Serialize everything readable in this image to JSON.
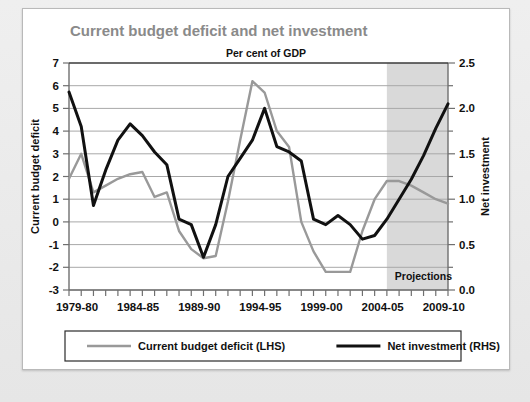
{
  "chart_data": {
    "type": "line",
    "title": "Current budget deficit and net investment",
    "subtitle": "Per cent of GDP",
    "annotation": "Projections",
    "xlabel": "",
    "ylabel": "Current budget deficit",
    "y2label": "Net investment",
    "grid": true,
    "legend_position": "bottom",
    "ylim": [
      -3,
      7
    ],
    "y2lim": [
      0.0,
      2.5
    ],
    "yticks": [
      7,
      6,
      5,
      4,
      3,
      2,
      1,
      0,
      -1,
      -2,
      -3
    ],
    "ytick_labels": [
      "7",
      "6",
      "5",
      "4",
      "3",
      "2",
      "1",
      "0",
      "-1",
      "-2",
      "-3"
    ],
    "y2ticks": [
      2.5,
      2.0,
      1.5,
      1.0,
      0.5,
      0.0
    ],
    "y2tick_labels": [
      "2.5",
      "2.0",
      "1.5",
      "1.0",
      "0.5",
      "0.0"
    ],
    "x": [
      "1979-80",
      "1980-81",
      "1981-82",
      "1982-83",
      "1983-84",
      "1984-85",
      "1985-86",
      "1986-87",
      "1987-88",
      "1988-89",
      "1989-90",
      "1990-91",
      "1991-92",
      "1992-93",
      "1993-94",
      "1994-95",
      "1995-96",
      "1996-97",
      "1997-98",
      "1998-99",
      "1999-00",
      "2000-01",
      "2001-02",
      "2002-03",
      "2003-04",
      "2004-05",
      "2005-06",
      "2006-07",
      "2007-08",
      "2008-09",
      "2009-10",
      "2010-11"
    ],
    "xtick_labels": [
      "1979-80",
      "1984-85",
      "1989-90",
      "1994-95",
      "1999-00",
      "2004-05",
      "2009-10"
    ],
    "xtick_indices": [
      0,
      5,
      10,
      15,
      20,
      25,
      30
    ],
    "projection_start_index": 26,
    "series": [
      {
        "name": "Current budget deficit (LHS)",
        "axis": "left",
        "color": "#999999",
        "values": [
          1.9,
          3.0,
          1.3,
          1.6,
          1.9,
          2.1,
          2.2,
          1.1,
          1.3,
          -0.4,
          -1.2,
          -1.6,
          -1.5,
          0.9,
          3.6,
          6.2,
          5.7,
          4.0,
          3.3,
          0.0,
          -1.3,
          -2.2,
          -2.2,
          -2.2,
          -0.4,
          1.0,
          1.8,
          1.8,
          1.6,
          1.3,
          1.0,
          0.8
        ]
      },
      {
        "name": "Net investment (RHS)",
        "axis": "right",
        "color": "#111111",
        "values": [
          2.18,
          1.8,
          0.93,
          1.32,
          1.65,
          1.83,
          1.7,
          1.52,
          1.38,
          0.78,
          0.72,
          0.36,
          0.72,
          1.25,
          1.45,
          1.65,
          2.0,
          1.58,
          1.52,
          1.42,
          0.78,
          0.72,
          0.82,
          0.72,
          0.56,
          0.6,
          0.78,
          1.0,
          1.22,
          1.48,
          1.78,
          2.05
        ]
      }
    ],
    "colors": {
      "deficit_line": "#999999",
      "investment_line": "#111111",
      "projection_band": "#d9d9d9",
      "gridline": "#a8a8a8",
      "title": "#8a8a8a",
      "panel_background": "#ffffff",
      "page_background": "#e9e9e9"
    }
  },
  "legend": {
    "items": [
      {
        "label": "Current budget deficit (LHS)",
        "color": "#999999",
        "weight": "thin"
      },
      {
        "label": "Net investment (RHS)",
        "color": "#111111",
        "weight": "thick"
      }
    ]
  }
}
